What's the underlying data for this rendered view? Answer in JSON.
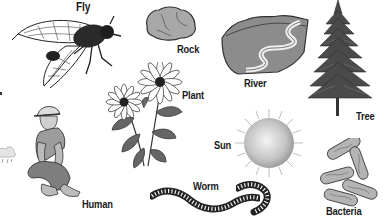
{
  "diagram": {
    "items": [
      {
        "id": "fly",
        "label": "Fly"
      },
      {
        "id": "rock",
        "label": "Rock"
      },
      {
        "id": "river",
        "label": "River"
      },
      {
        "id": "tree",
        "label": "Tree"
      },
      {
        "id": "plant",
        "label": "Plant"
      },
      {
        "id": "sun",
        "label": "Sun"
      },
      {
        "id": "human",
        "label": "Human"
      },
      {
        "id": "worm",
        "label": "Worm"
      },
      {
        "id": "bacteria",
        "label": "Bacteria"
      },
      {
        "id": "cloud",
        "label": ""
      }
    ]
  },
  "colors": {
    "ink": "#1a1a1a",
    "light_gray": "#c8c8c8",
    "mid_gray": "#9a9a9a",
    "dark_gray": "#555555"
  }
}
